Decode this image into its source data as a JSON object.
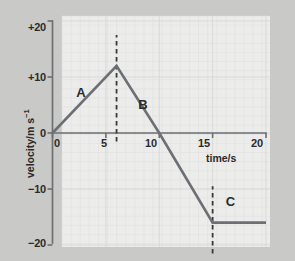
{
  "figure": {
    "background_color": "#c9c9c7",
    "plot_background_color": "#ececeb",
    "line_color": "#6c6f73",
    "text_color": "#2b2b2b",
    "grid_color": "#dcdcda"
  },
  "chart_data": {
    "type": "line",
    "title": "",
    "xlabel": "time/s",
    "ylabel": "velocity/m s⁻¹",
    "ylabel_base": "velocity/m s",
    "ylabel_exponent": "−1",
    "xlim": [
      0,
      20
    ],
    "ylim": [
      -20,
      20
    ],
    "xticks": [
      0,
      5,
      10,
      15,
      20
    ],
    "xtick_labels": [
      "0",
      "5",
      "10",
      "15",
      "20"
    ],
    "yticks": [
      20,
      10,
      0,
      -10,
      -20
    ],
    "ytick_labels": [
      "+20",
      "+10",
      "0",
      "−10",
      "−20"
    ],
    "grid": true,
    "legend": "none",
    "series": [
      {
        "name": "velocity",
        "x": [
          0,
          6,
          10,
          15,
          20
        ],
        "y": [
          0,
          12,
          0,
          -16,
          -16
        ]
      }
    ],
    "annotations": [
      {
        "label": "A",
        "x": 2.6,
        "y": 7.2,
        "describes": "acceleration phase 0 to 6 s"
      },
      {
        "label": "B",
        "x": 8.4,
        "y": 5.0,
        "describes": "deceleration and reversal 6 to 15 s"
      },
      {
        "label": "C",
        "x": 16.6,
        "y": -12.4,
        "describes": "constant negative velocity 15 to 20 s"
      }
    ],
    "markers": [
      {
        "type": "vertical-dashed-line",
        "x": 6,
        "y_from": -1.5,
        "y_to": 17.5
      },
      {
        "type": "vertical-dashed-line",
        "x": 15,
        "y_from": -21.5,
        "y_to": -9.5
      }
    ]
  }
}
